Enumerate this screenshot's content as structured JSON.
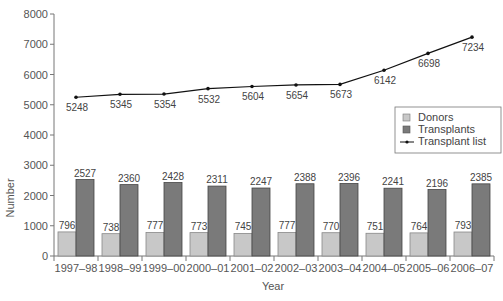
{
  "chart_data": {
    "type": "bar",
    "title": "",
    "xlabel": "Year",
    "ylabel": "Number",
    "ylim": [
      0,
      8000
    ],
    "yticks": [
      0,
      1000,
      2000,
      3000,
      4000,
      5000,
      6000,
      7000,
      8000
    ],
    "grid": false,
    "legend_position": "right-middle",
    "categories": [
      "1997–98",
      "1998–99",
      "1999–00",
      "2000–01",
      "2001–02",
      "2002–03",
      "2003–04",
      "2004–05",
      "2005–06",
      "2006–07"
    ],
    "series": [
      {
        "name": "Donors",
        "type": "bar",
        "color": "#c8c8c8",
        "values": [
          796,
          738,
          777,
          773,
          745,
          777,
          770,
          751,
          764,
          793
        ]
      },
      {
        "name": "Transplants",
        "type": "bar",
        "color": "#7a7a7a",
        "values": [
          2527,
          2360,
          2428,
          2311,
          2247,
          2388,
          2396,
          2241,
          2196,
          2385
        ]
      },
      {
        "name": "Transplant list",
        "type": "line",
        "color": "#111111",
        "values": [
          5248,
          5345,
          5354,
          5532,
          5604,
          5654,
          5673,
          6142,
          6698,
          7234
        ]
      }
    ]
  },
  "legend": {
    "items": [
      "Donors",
      "Transplants",
      "Transplant list"
    ]
  }
}
